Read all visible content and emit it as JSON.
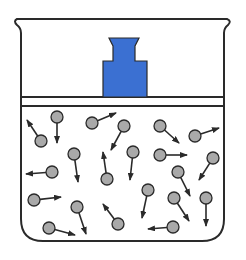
{
  "diagram": {
    "colors": {
      "outline": "#2a2a2a",
      "weight_fill": "#3b70d2",
      "molecule_fill": "#a9a9a9",
      "background": "#ffffff"
    },
    "container": {
      "left_wall_x": 21,
      "right_wall_x": 224,
      "rim_y": 19,
      "bottom_y": 241,
      "corner_radius": 22
    },
    "piston": {
      "top_y": 97,
      "bottom_y": 106
    },
    "weight": {
      "top_y": 38,
      "top_left_x": 109,
      "top_right_x": 139,
      "neck_left_x": 113,
      "neck_right_x": 135,
      "shoulder_y": 61,
      "body_left_x": 103,
      "body_right_x": 147,
      "bottom_y": 97
    },
    "molecules": [
      {
        "cx": 41,
        "cy": 141,
        "tx": 27,
        "ty": 120
      },
      {
        "cx": 57,
        "cy": 117,
        "tx": 57,
        "ty": 143
      },
      {
        "cx": 74,
        "cy": 154,
        "tx": 78,
        "ty": 182
      },
      {
        "cx": 52,
        "cy": 172,
        "tx": 26,
        "ty": 174
      },
      {
        "cx": 92,
        "cy": 123,
        "tx": 116,
        "ty": 113
      },
      {
        "cx": 124,
        "cy": 126,
        "tx": 111,
        "ty": 150
      },
      {
        "cx": 133,
        "cy": 152,
        "tx": 130,
        "ty": 180
      },
      {
        "cx": 107,
        "cy": 179,
        "tx": 103,
        "ty": 152
      },
      {
        "cx": 160,
        "cy": 126,
        "tx": 179,
        "ty": 143
      },
      {
        "cx": 195,
        "cy": 136,
        "tx": 219,
        "ty": 128
      },
      {
        "cx": 160,
        "cy": 155,
        "tx": 187,
        "ty": 155
      },
      {
        "cx": 213,
        "cy": 158,
        "tx": 199,
        "ty": 180
      },
      {
        "cx": 178,
        "cy": 172,
        "tx": 190,
        "ty": 196
      },
      {
        "cx": 34,
        "cy": 200,
        "tx": 61,
        "ty": 197
      },
      {
        "cx": 77,
        "cy": 207,
        "tx": 86,
        "ty": 234
      },
      {
        "cx": 49,
        "cy": 228,
        "tx": 75,
        "ty": 235
      },
      {
        "cx": 118,
        "cy": 224,
        "tx": 103,
        "ty": 204
      },
      {
        "cx": 148,
        "cy": 190,
        "tx": 142,
        "ty": 218
      },
      {
        "cx": 173,
        "cy": 227,
        "tx": 148,
        "ty": 229
      },
      {
        "cx": 174,
        "cy": 198,
        "tx": 189,
        "ty": 221
      },
      {
        "cx": 206,
        "cy": 198,
        "tx": 206,
        "ty": 226
      }
    ]
  }
}
